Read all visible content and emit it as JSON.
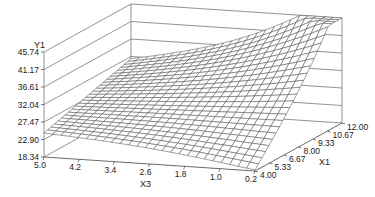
{
  "chart_data": {
    "type": "surface3d",
    "title": "",
    "axes": {
      "z": {
        "label": "Y1",
        "ticks": [
          "18.34",
          "22.90",
          "27.47",
          "32.04",
          "36.61",
          "41.17",
          "45.74"
        ],
        "range": [
          18.34,
          45.74
        ]
      },
      "x3": {
        "label": "X3",
        "ticks": [
          "5.0",
          "4.2",
          "3.4",
          "2.6",
          "1.8",
          "1.0",
          "0.2"
        ],
        "range": [
          5.0,
          0.2
        ]
      },
      "x1": {
        "label": "X1",
        "ticks": [
          "4.00",
          "5.33",
          "6.67",
          "8.00",
          "9.33",
          "10.67",
          "12.00"
        ],
        "range": [
          4.0,
          12.0
        ]
      }
    },
    "grid": true,
    "surface_grid_size": [
      25,
      25
    ],
    "corner_values": {
      "x3_5.0_x1_4.00": 24.6,
      "x3_0.2_x1_4.00": 18.6,
      "x3_5.0_x1_12.00": 31.5,
      "x3_0.2_x1_12.00": 45.74
    },
    "colors": {
      "line": "#555555",
      "axis": "#666666",
      "text": "#222222",
      "background": "#ffffff"
    }
  }
}
